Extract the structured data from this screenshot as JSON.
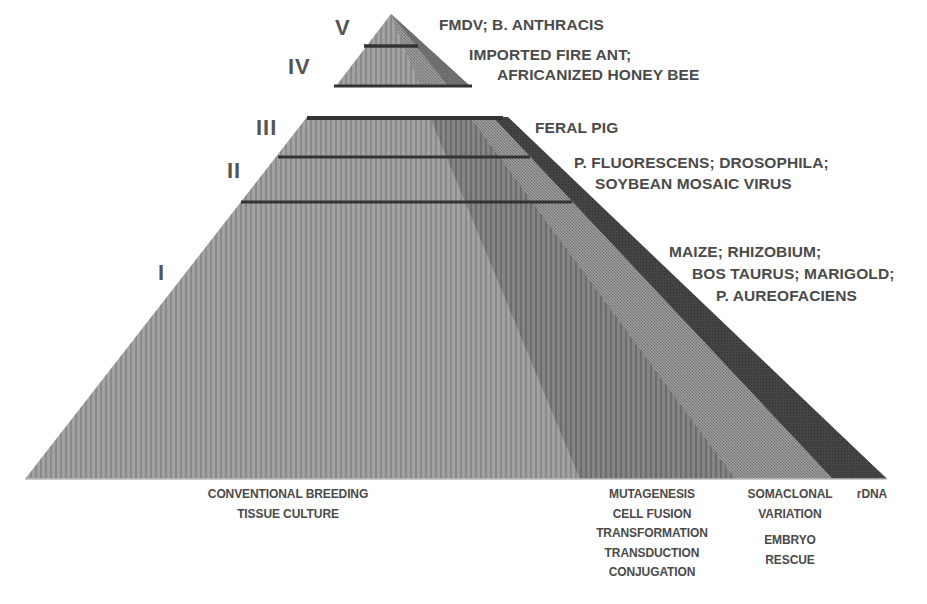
{
  "diagram": {
    "type": "pyramid",
    "levels": [
      {
        "roman": "V",
        "organisms": [
          "FMDV; B. ANTHRACIS"
        ]
      },
      {
        "roman": "IV",
        "organisms": [
          "IMPORTED FIRE ANT;",
          "AFRICANIZED HONEY BEE"
        ]
      },
      {
        "roman": "III",
        "organisms": [
          "FERAL PIG"
        ]
      },
      {
        "roman": "II",
        "organisms": [
          "P. FLUORESCENS; DROSOPHILA;",
          "SOYBEAN MOSAIC VIRUS"
        ]
      },
      {
        "roman": "I",
        "organisms": [
          "MAIZE; RHIZOBIUM;",
          "BOS TAURUS; MARIGOLD;",
          "P. AUREOFACIENS"
        ]
      }
    ],
    "techniques": [
      {
        "id": "conventional",
        "lines": [
          "CONVENTIONAL BREEDING",
          "TISSUE CULTURE"
        ]
      },
      {
        "id": "mutagenesis",
        "lines": [
          "MUTAGENESIS",
          "CELL FUSION",
          "TRANSFORMATION",
          "TRANSDUCTION",
          "CONJUGATION"
        ]
      },
      {
        "id": "somaclonal",
        "lines": [
          "SOMACLONAL",
          "VARIATION"
        ]
      },
      {
        "id": "embryo",
        "lines": [
          "EMBRYO",
          "RESCUE"
        ]
      },
      {
        "id": "rdna",
        "lines": [
          "rDNA"
        ]
      }
    ],
    "colors": {
      "light_band": "#9a9a9a",
      "mid_band": "#7e7e7e",
      "stipple_band": "#8c8c8c",
      "dark_band": "#3c3c3c",
      "divider": "#333333",
      "text": "#4a4a4a"
    }
  }
}
